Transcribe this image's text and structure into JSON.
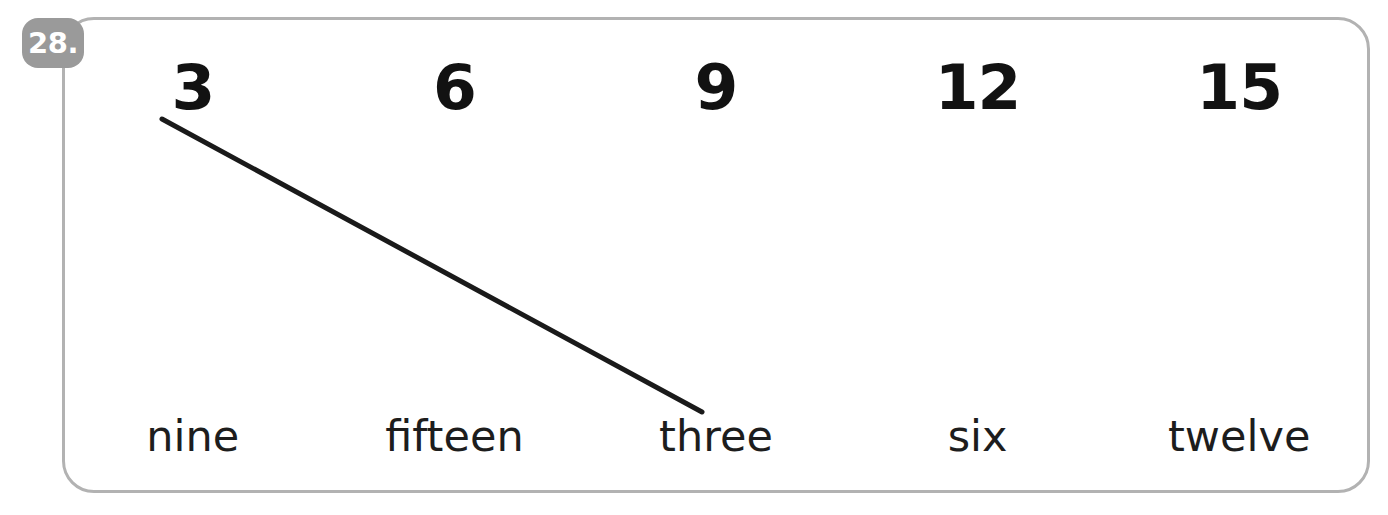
{
  "exercise": {
    "number_badge": "28.",
    "badge_color": "#9a9a9a",
    "border_color": "#b2b2b2",
    "background_color": "#ffffff",
    "ink_color": "#1a1a1a"
  },
  "numerals": [
    {
      "label": "3"
    },
    {
      "label": "6"
    },
    {
      "label": "9"
    },
    {
      "label": "12"
    },
    {
      "label": "15"
    }
  ],
  "words": [
    {
      "label": "nine"
    },
    {
      "label": "fifteen"
    },
    {
      "label": "three"
    },
    {
      "label": "six"
    },
    {
      "label": "twelve"
    }
  ],
  "drawn_lines": [
    {
      "from": "3",
      "to": "three",
      "x1": 162,
      "y1": 119,
      "x2": 702,
      "y2": 412,
      "stroke": "#1a1a1a",
      "width": 5
    }
  ]
}
